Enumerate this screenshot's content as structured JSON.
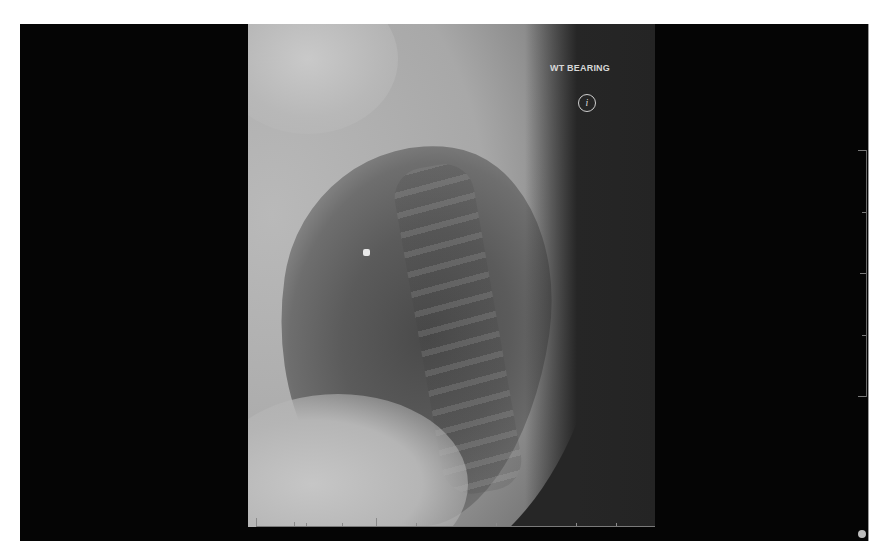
{
  "viewer": {
    "image_type": "lateral chest radiograph",
    "annotation_label": "WT BEARING",
    "info_button_glyph": "i",
    "corner_text": "",
    "colors": {
      "background": "#050505",
      "image_dark": "#262626",
      "annotation_text": "#d8d8d8"
    },
    "horizontal_ruler": {
      "major_ticks": [
        0,
        10,
        13,
        22,
        38
      ]
    },
    "vertical_ruler": {
      "ticks": [
        0,
        0.25,
        0.5,
        0.75,
        1.0
      ]
    }
  },
  "icons": {
    "info": "info-icon",
    "scroll_knob": "scroll-handle-icon"
  }
}
